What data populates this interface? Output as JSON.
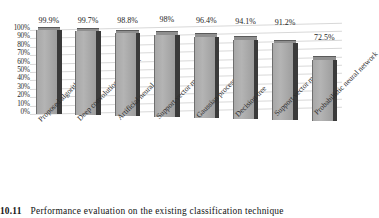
{
  "chart_data": {
    "type": "bar",
    "title": "",
    "xlabel": "",
    "ylabel": "",
    "grid": true,
    "legend": "none",
    "ylim": [
      0,
      100
    ],
    "yticks": [
      "100%",
      "90%",
      "80%",
      "70%",
      "60%",
      "50%",
      "40%",
      "30%",
      "20%",
      "10%",
      "0%"
    ],
    "categories": [
      "Proposed algorithm",
      "Deep convolutional neural...",
      "Artificial neural network",
      "Support vector machine",
      "Gaussian process",
      "Decision tree",
      "Support vector machine",
      "Probabilistic neural network"
    ],
    "values": [
      99.9,
      99.7,
      98.8,
      98,
      96.4,
      94.1,
      91.2,
      72.5
    ],
    "data_labels": [
      "99.9%",
      "99.7%",
      "98.8%",
      "98%",
      "96.4%",
      "94.1%",
      "91.2%",
      "72.5%"
    ],
    "series": [
      {
        "name": "Accuracy",
        "values": [
          99.9,
          99.7,
          98.8,
          98,
          96.4,
          94.1,
          91.2,
          72.5
        ]
      }
    ],
    "colors": {
      "bar_front": "#b0b0b0",
      "bar_side": "#3a3a3a",
      "bar_top": "#8f8f8f",
      "gridline": "#d8d8d8",
      "text": "#2b2b2b",
      "background": "#ffffff"
    }
  },
  "caption": {
    "number": "RE 10.11",
    "text": "Performance evaluation on the existing classification technique"
  }
}
